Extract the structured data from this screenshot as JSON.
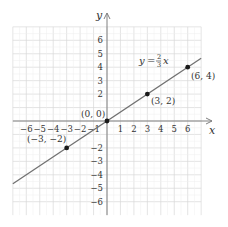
{
  "chart_data": {
    "type": "line",
    "title": "",
    "xlabel": "x",
    "ylabel": "y",
    "xlim": [
      -7,
      7
    ],
    "ylim": [
      -7,
      7
    ],
    "grid": true,
    "x_ticks": [
      -6,
      -5,
      -4,
      -3,
      -2,
      -1,
      1,
      2,
      3,
      4,
      5,
      6
    ],
    "y_ticks": [
      -6,
      -5,
      -4,
      -3,
      -2,
      2,
      3,
      4,
      5,
      6
    ],
    "x_tick_labels": [
      "−6",
      "−5",
      "−4",
      "−3",
      "−2",
      "−1",
      "1",
      "2",
      "3",
      "4",
      "5",
      "6"
    ],
    "y_tick_labels": [
      "−6",
      "−5",
      "−4",
      "−3",
      "−2",
      "2",
      "3",
      "4",
      "5",
      "6"
    ],
    "series": [
      {
        "name": "y = 2/3 x",
        "equation": "y = (2/3)x",
        "slope": 0.6667,
        "intercept": 0,
        "x": [
          -7,
          7
        ],
        "y": [
          -4.667,
          4.667
        ]
      }
    ],
    "points": [
      {
        "x": -3,
        "y": -2,
        "label": "(−3, −2)"
      },
      {
        "x": 0,
        "y": 0,
        "label": "(0, 0)"
      },
      {
        "x": 3,
        "y": 2,
        "label": "(3, 2)"
      },
      {
        "x": 6,
        "y": 4,
        "label": "(6, 4)"
      }
    ],
    "annotations": [
      {
        "text": "y = 2/3 x",
        "near": [
          3,
          4.5
        ]
      }
    ],
    "colors": {
      "line": "#707070",
      "grid": "#d8d8d8",
      "axis": "#808080",
      "point": "#1a1a1a"
    }
  },
  "labels": {
    "x_axis": "x",
    "y_axis": "y",
    "eq_y": "y",
    "eq_equals": "=",
    "eq_num": "2",
    "eq_den": "3",
    "eq_x": "x",
    "origin_label": "(0, 0)",
    "p1": "(−3, −2)",
    "p2": "(3, 2)",
    "p3": "(6, 4)"
  }
}
